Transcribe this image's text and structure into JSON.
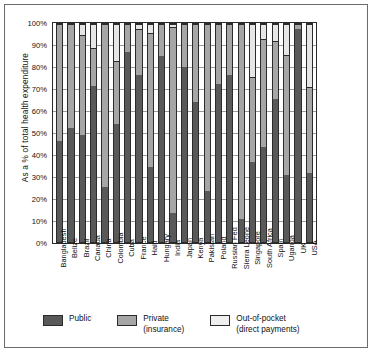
{
  "chart_data": {
    "type": "bar",
    "subtype": "100% stacked column",
    "title": "",
    "xlabel": "",
    "ylabel": "As a % of total health expenditure",
    "ylim": [
      0,
      100
    ],
    "grid": true,
    "legend_position": "bottom",
    "ytick_labels": [
      "100%",
      "90%",
      "80%",
      "70%",
      "60%",
      "50%",
      "40%",
      "30%",
      "20%",
      "10%",
      "0%"
    ],
    "ytick_values": [
      100,
      90,
      80,
      70,
      60,
      50,
      40,
      30,
      20,
      10,
      0
    ],
    "categories": [
      "Bangladesh",
      "Belize",
      "Brazil",
      "Canada",
      "China",
      "Colombia",
      "Cuba",
      "France",
      "Haiti",
      "Hungary",
      "India",
      "Japan",
      "Kenya",
      "Pakistan",
      "Poland",
      "Russian Fed",
      "Sierra Leone",
      "Singapore",
      "South Africa",
      "Spain",
      "Uganda",
      "UK",
      "USA"
    ],
    "series": [
      {
        "name": "Public",
        "color": "#595959",
        "values": [
          46.5,
          52.5,
          49.5,
          72.0,
          25.5,
          54.5,
          87.5,
          77.5,
          34.5,
          85.5,
          13.5,
          80.5,
          64.5,
          23.5,
          73.0,
          77.0,
          10.5,
          37.0,
          44.0,
          66.0,
          31.0,
          98.0,
          32.0
        ]
      },
      {
        "name": "Private (insurance)",
        "color": "#a6a6a6",
        "values": [
          53.5,
          47.5,
          46.0,
          17.5,
          74.5,
          29.0,
          12.5,
          20.5,
          62.0,
          14.5,
          85.5,
          19.5,
          35.5,
          76.5,
          27.0,
          23.0,
          89.5,
          39.0,
          49.5,
          26.5,
          55.0,
          2.0,
          39.5
        ]
      },
      {
        "name": "Out-of-pocket (direct payments)",
        "color": "#e6e6e6",
        "values": [
          0.0,
          0.0,
          4.5,
          10.5,
          0.0,
          16.5,
          0.0,
          2.0,
          3.5,
          0.0,
          1.0,
          0.0,
          0.0,
          0.0,
          0.0,
          0.0,
          0.0,
          24.0,
          6.5,
          7.5,
          14.0,
          0.0,
          28.5
        ]
      }
    ]
  },
  "legend": {
    "items": [
      {
        "label_line1": "Public",
        "label_line2": ""
      },
      {
        "label_line1": "Private",
        "label_line2": "(insurance)"
      },
      {
        "label_line1": "Out-of-pocket",
        "label_line2": "(direct payments)"
      }
    ]
  },
  "colors": {
    "public": "#595959",
    "private": "#a6a6a6",
    "out_of_pocket": "#e6e6e6",
    "axis": "#2b2b2b",
    "grid": "#9a9a9a",
    "frame": "#6b6b6b"
  }
}
